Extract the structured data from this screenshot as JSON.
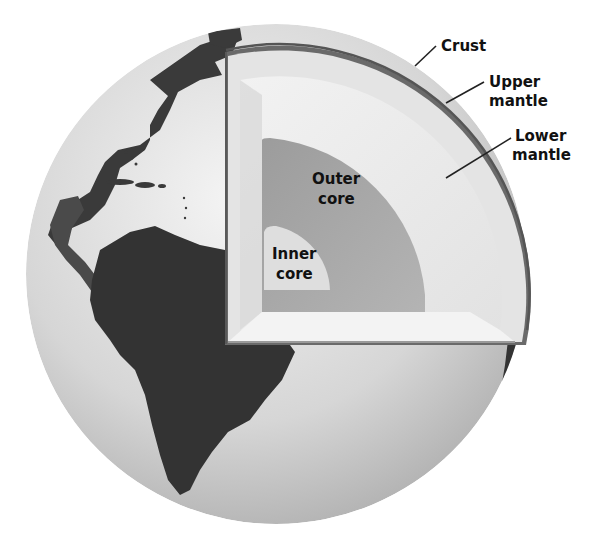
{
  "diagram": {
    "labels": {
      "crust": "Crust",
      "upper_mantle_1": "Upper",
      "upper_mantle_2": "mantle",
      "lower_mantle_1": "Lower",
      "lower_mantle_2": "mantle",
      "outer_core_1": "Outer",
      "outer_core_2": "core",
      "inner_core_1": "Inner",
      "inner_core_2": "core"
    },
    "layers": [
      "Crust",
      "Upper mantle",
      "Lower mantle",
      "Outer core",
      "Inner core"
    ],
    "colors": {
      "ocean": "#d8d8d8",
      "land": "#3a3a3a",
      "crust": "#6a6a6a",
      "upper_mantle": "#e6e6e6",
      "lower_mantle": "#ececec",
      "outer_core": "#a9a9a9",
      "inner_core": "#dcdcdc"
    }
  }
}
